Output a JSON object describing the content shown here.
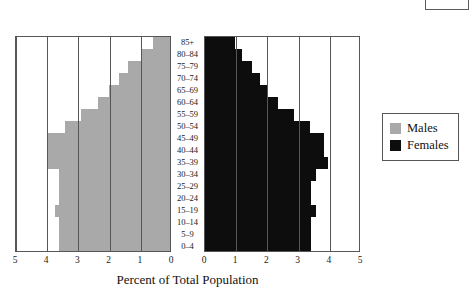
{
  "chart_data": {
    "type": "bar",
    "subtype": "population-pyramid",
    "title": "",
    "xlabel": "Percent of Total Population",
    "ylabel": "",
    "categories": [
      "0–4",
      "5–9",
      "10–14",
      "15–19",
      "20–24",
      "25–29",
      "30–34",
      "35–39",
      "40–44",
      "45–49",
      "50–54",
      "55–59",
      "60–64",
      "65–69",
      "70–74",
      "75–79",
      "80–84",
      "85+"
    ],
    "xlim": [
      0,
      5
    ],
    "xticks": [
      0,
      1,
      2,
      3,
      4,
      5
    ],
    "left_axis_ticks": [
      "5",
      "4",
      "3",
      "2",
      "1",
      "0"
    ],
    "right_axis_ticks": [
      "0",
      "1",
      "2",
      "3",
      "4",
      "5"
    ],
    "grid": true,
    "legend_position": "right",
    "series": [
      {
        "name": "Males",
        "color": "#a9a9a9",
        "direction": "left",
        "values": [
          3.55,
          3.55,
          3.55,
          3.7,
          3.55,
          3.55,
          3.55,
          3.9,
          3.9,
          3.9,
          3.35,
          2.85,
          2.3,
          1.95,
          1.65,
          1.35,
          0.9,
          0.55
        ]
      },
      {
        "name": "Females",
        "color": "#0d0d0d",
        "direction": "right",
        "values": [
          3.4,
          3.4,
          3.4,
          3.55,
          3.4,
          3.4,
          3.55,
          3.95,
          3.8,
          3.8,
          3.35,
          2.85,
          2.35,
          2.0,
          1.75,
          1.5,
          1.2,
          0.95
        ]
      }
    ]
  },
  "legend": {
    "items": [
      {
        "label": "Males",
        "color": "#a9a9a9"
      },
      {
        "label": "Females",
        "color": "#0d0d0d"
      }
    ]
  },
  "axis_title": "Percent of Total Population"
}
